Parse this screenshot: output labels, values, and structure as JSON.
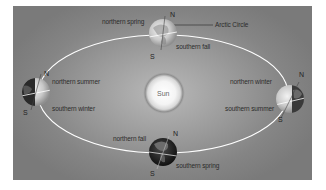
{
  "diagram": {
    "type": "seasons-earth-orbit",
    "center_label": "Sun",
    "annotation": "Arctic Circle",
    "positions": [
      {
        "id": "top",
        "northern": "northern spring",
        "southern": "southern fall",
        "north_pole": "N",
        "south_pole": "S"
      },
      {
        "id": "left",
        "northern": "northern summer",
        "southern": "southern winter",
        "north_pole": "N",
        "south_pole": "S"
      },
      {
        "id": "right",
        "northern": "northern winter",
        "southern": "southern summer",
        "north_pole": "N",
        "south_pole": "S"
      },
      {
        "id": "bottom",
        "northern": "northern fall",
        "southern": "southern spring",
        "north_pole": "N",
        "south_pole": "S"
      }
    ],
    "colors": {
      "background": "#8a8a8a",
      "orbit": "#ffffff",
      "sun_core": "#ffffff",
      "sun_halo": "#6e6e6e",
      "text": "#2c2c2c"
    }
  }
}
